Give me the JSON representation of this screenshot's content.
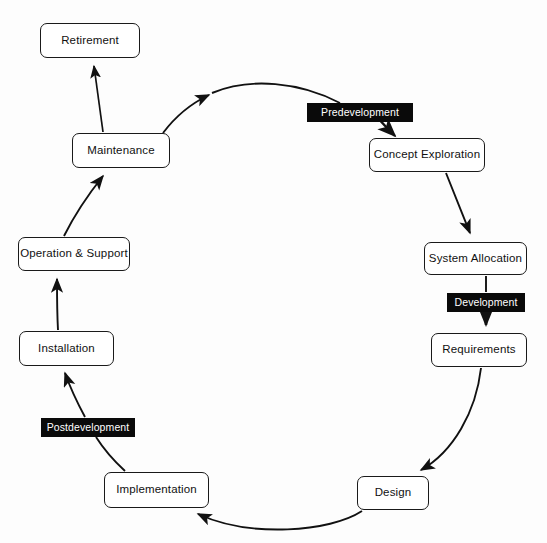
{
  "diagram": {
    "background_color": "#fdfdfd",
    "node_fill": "#ffffff",
    "node_stroke": "#1a1a1a",
    "phase_label_fill": "#0a0a0a",
    "phase_label_text_color": "#ffffff",
    "nodes": [
      {
        "id": "retirement",
        "label": "Retirement",
        "x": 40,
        "y": 23,
        "w": 100,
        "h": 35
      },
      {
        "id": "maintenance",
        "label": "Maintenance",
        "x": 72,
        "y": 133,
        "w": 98,
        "h": 35
      },
      {
        "id": "operation-support",
        "label": "Operation & Support",
        "x": 18,
        "y": 237,
        "w": 112,
        "h": 34
      },
      {
        "id": "installation",
        "label": "Installation",
        "x": 19,
        "y": 331,
        "w": 95,
        "h": 35
      },
      {
        "id": "implementation",
        "label": "Implementation",
        "x": 104,
        "y": 472,
        "w": 105,
        "h": 36
      },
      {
        "id": "design",
        "label": "Design",
        "x": 357,
        "y": 476,
        "w": 72,
        "h": 34
      },
      {
        "id": "requirements",
        "label": "Requirements",
        "x": 431,
        "y": 333,
        "w": 96,
        "h": 34
      },
      {
        "id": "system-allocation",
        "label": "System Allocation",
        "x": 424,
        "y": 242,
        "w": 103,
        "h": 33
      },
      {
        "id": "concept-exploration",
        "label": "Concept Exploration",
        "x": 369,
        "y": 138,
        "w": 116,
        "h": 34
      }
    ],
    "phase_labels": [
      {
        "id": "predevelopment",
        "label": "Predevelopment",
        "x": 307,
        "y": 103,
        "w": 106,
        "h": 19
      },
      {
        "id": "development",
        "label": "Development",
        "x": 447,
        "y": 293,
        "w": 78,
        "h": 19
      },
      {
        "id": "postdevelopment",
        "label": "Postdevelopment",
        "x": 41,
        "y": 418,
        "w": 94,
        "h": 19
      }
    ],
    "edges": [
      {
        "id": "maintenance-to-retirement",
        "from": "maintenance",
        "to": "retirement"
      },
      {
        "id": "maintenance-to-predevelopment",
        "from": "maintenance",
        "to": "predevelopment"
      },
      {
        "id": "predevelopment-to-concept",
        "from": "predevelopment",
        "to": "concept-exploration"
      },
      {
        "id": "concept-to-system-allocation",
        "from": "concept-exploration",
        "to": "system-allocation"
      },
      {
        "id": "system-allocation-to-development",
        "from": "system-allocation",
        "to": "development"
      },
      {
        "id": "development-to-requirements",
        "from": "development",
        "to": "requirements"
      },
      {
        "id": "requirements-to-design",
        "from": "requirements",
        "to": "design"
      },
      {
        "id": "design-to-implementation",
        "from": "design",
        "to": "implementation"
      },
      {
        "id": "implementation-to-postdevelopment",
        "from": "implementation",
        "to": "postdevelopment"
      },
      {
        "id": "postdevelopment-to-installation",
        "from": "postdevelopment",
        "to": "installation"
      },
      {
        "id": "installation-to-operation-support",
        "from": "installation",
        "to": "operation-support"
      },
      {
        "id": "operation-support-to-maintenance",
        "from": "operation-support",
        "to": "maintenance"
      }
    ]
  }
}
